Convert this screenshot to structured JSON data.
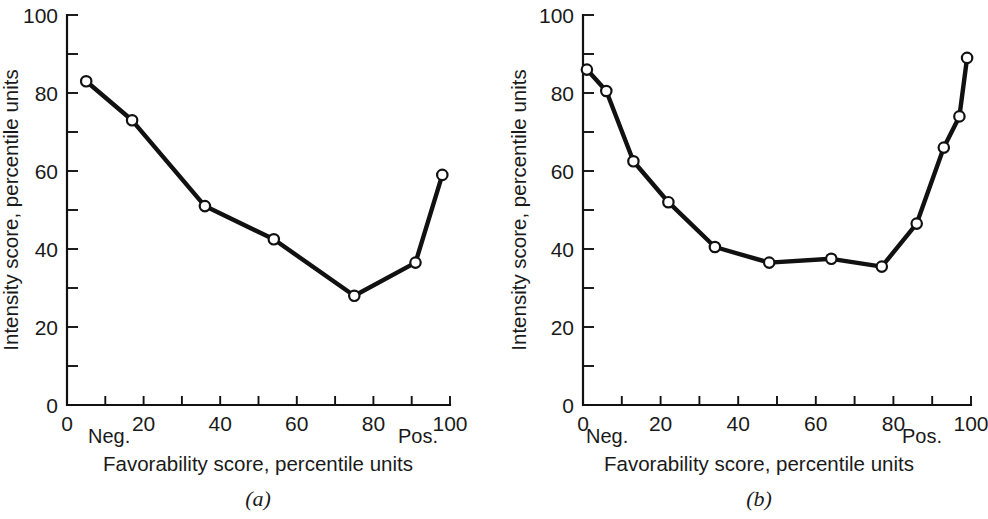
{
  "figure": {
    "panels": [
      {
        "caption": "(a)",
        "xlabel": "Favorability score,  percentile units",
        "ylabel": "Intensity score,  percentile units",
        "x_left_note": "Neg.",
        "x_right_note": "Pos.",
        "x_ticks_major": [
          "0",
          "20",
          "40",
          "60",
          "80",
          "100"
        ],
        "y_ticks_major": [
          "0",
          "20",
          "40",
          "60",
          "80",
          "100"
        ]
      },
      {
        "caption": "(b)",
        "xlabel": "Favorability score, percentile units",
        "ylabel": "Intensity score, percentile units",
        "x_left_note": "Neg.",
        "x_right_note": "Pos.",
        "x_ticks_major": [
          "0",
          "20",
          "40",
          "60",
          "80",
          "100"
        ],
        "y_ticks_major": [
          "0",
          "20",
          "40",
          "60",
          "80",
          "100"
        ]
      }
    ]
  },
  "chart_data": [
    {
      "type": "line",
      "title": "(a)",
      "xlabel": "Favorability score,  percentile units",
      "ylabel": "Intensity score,  percentile units",
      "xlim": [
        0,
        100
      ],
      "ylim": [
        0,
        100
      ],
      "xticks": [
        0,
        10,
        20,
        30,
        40,
        50,
        60,
        70,
        80,
        90,
        100
      ],
      "xticklabels": [
        "0",
        "",
        "20",
        "",
        "40",
        "",
        "60",
        "",
        "80",
        "",
        "100"
      ],
      "yticks": [
        0,
        10,
        20,
        30,
        40,
        50,
        60,
        70,
        80,
        90,
        100
      ],
      "yticklabels": [
        "0",
        "",
        "20",
        "",
        "40",
        "",
        "60",
        "",
        "80",
        "",
        "100"
      ],
      "grid": false,
      "legend": null,
      "marker": "open-circle",
      "annotations": [
        {
          "text": "Neg.",
          "x": 5,
          "position": "below-axis-left"
        },
        {
          "text": "Pos.",
          "x": 90,
          "position": "below-axis-right"
        }
      ],
      "x": [
        5,
        17,
        36,
        54,
        75,
        91,
        98
      ],
      "y": [
        83,
        73,
        51,
        42.5,
        28,
        36.5,
        59
      ]
    },
    {
      "type": "line",
      "title": "(b)",
      "xlabel": "Favorability score, percentile units",
      "ylabel": "Intensity score, percentile units",
      "xlim": [
        0,
        100
      ],
      "ylim": [
        0,
        100
      ],
      "xticks": [
        0,
        10,
        20,
        30,
        40,
        50,
        60,
        70,
        80,
        90,
        100
      ],
      "xticklabels": [
        "0",
        "",
        "20",
        "",
        "40",
        "",
        "60",
        "",
        "80",
        "",
        "100"
      ],
      "yticks": [
        0,
        10,
        20,
        30,
        40,
        50,
        60,
        70,
        80,
        90,
        100
      ],
      "yticklabels": [
        "0",
        "",
        "20",
        "",
        "40",
        "",
        "60",
        "",
        "80",
        "",
        "100"
      ],
      "grid": false,
      "legend": null,
      "marker": "open-circle",
      "annotations": [
        {
          "text": "Neg.",
          "x": 5,
          "position": "below-axis-left"
        },
        {
          "text": "Pos.",
          "x": 90,
          "position": "below-axis-right"
        }
      ],
      "x": [
        1,
        6,
        13,
        22,
        34,
        48,
        64,
        77,
        86,
        93,
        97,
        99
      ],
      "y": [
        86,
        80.5,
        62.5,
        52,
        40.5,
        36.5,
        37.5,
        35.5,
        46.5,
        66,
        74,
        89
      ]
    }
  ]
}
